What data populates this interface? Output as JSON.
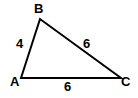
{
  "diagram": {
    "type": "triangle",
    "vertices": {
      "A": {
        "label": "A"
      },
      "B": {
        "label": "B"
      },
      "C": {
        "label": "C"
      }
    },
    "sides": {
      "AB": {
        "label": "4"
      },
      "BC": {
        "label": "6"
      },
      "AC": {
        "label": "6"
      }
    },
    "line_color": "#000000"
  }
}
